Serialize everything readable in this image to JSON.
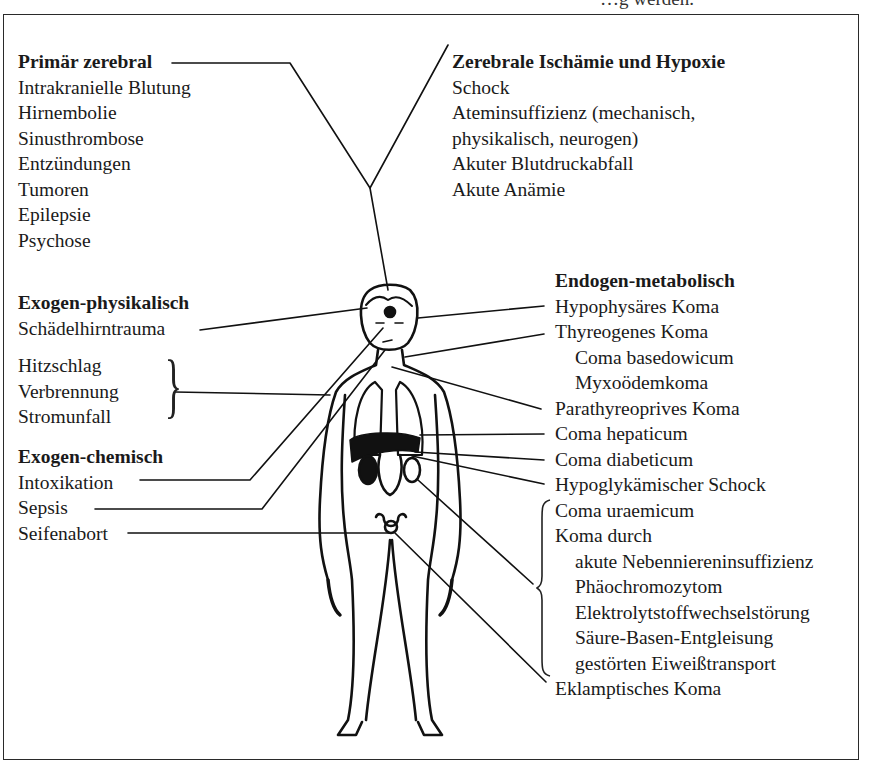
{
  "top_fragment": "…g   werden.",
  "groups": {
    "primaer_zerebral": {
      "title": "Primär zerebral",
      "items": [
        "Intrakranielle Blutung",
        "Hirnembolie",
        "Sinusthrombose",
        "Entzündungen",
        "Tumoren",
        "Epilepsie",
        "Psychose"
      ]
    },
    "ischaemie_hypoxie": {
      "title": "Zerebrale Ischämie und Hypoxie",
      "items": [
        "Schock",
        "Ateminsuffizienz (mechanisch,",
        "physikalisch, neurogen)",
        "Akuter Blutdruckabfall",
        "Akute Anämie"
      ]
    },
    "exogen_physikalisch": {
      "title": "Exogen-physikalisch",
      "items": [
        "Schädelhirntrauma"
      ],
      "bracketed": [
        "Hitzschlag",
        "Verbrennung",
        "Stromunfall"
      ]
    },
    "exogen_chemisch": {
      "title": "Exogen-chemisch",
      "items": [
        "Intoxikation",
        "Sepsis",
        "Seifenabort"
      ]
    },
    "endogen_metabolisch": {
      "title": "Endogen-metabolisch",
      "items": [
        {
          "label": "Hypophysäres Koma",
          "indent": false
        },
        {
          "label": "Thyreogenes Koma",
          "indent": false
        },
        {
          "label": "Coma basedowicum",
          "indent": true
        },
        {
          "label": "Myxoödemkoma",
          "indent": true
        },
        {
          "label": "Parathyreoprives Koma",
          "indent": false
        },
        {
          "label": "Coma hepaticum",
          "indent": false
        },
        {
          "label": "Coma diabeticum",
          "indent": false
        },
        {
          "label": "Hypoglykämischer Schock",
          "indent": false
        },
        {
          "label": "Coma uraemicum",
          "indent": false
        },
        {
          "label": "Koma durch",
          "indent": false
        },
        {
          "label": "akute Nebenniereninsuffizienz",
          "indent": true
        },
        {
          "label": "Phäochromozytom",
          "indent": true
        },
        {
          "label": "Elektrolytstoffwechselstörung",
          "indent": true
        },
        {
          "label": "Säure-Basen-Entgleisung",
          "indent": true
        },
        {
          "label": "gestörten Eiweißtransport",
          "indent": true
        },
        {
          "label": "Eklamptisches Koma",
          "indent": false
        }
      ]
    }
  },
  "figure": {
    "line_color": "#111111"
  }
}
